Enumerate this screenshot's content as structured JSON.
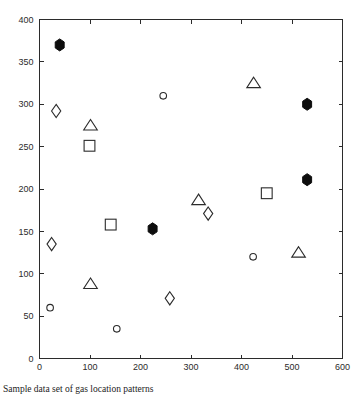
{
  "caption": "Sample data set of gas location patterns",
  "colors": {
    "axis": "#2b2b2b",
    "marker_open_stroke": "#2b2b2b",
    "marker_filled": "#0d0d0d",
    "background": "#ffffff"
  },
  "chart_data": {
    "type": "scatter",
    "title": "",
    "xlabel": "",
    "ylabel": "",
    "xlim": [
      0,
      600
    ],
    "ylim": [
      0,
      400
    ],
    "xticks": [
      0,
      100,
      200,
      300,
      400,
      500,
      600
    ],
    "yticks": [
      0,
      50,
      100,
      150,
      200,
      250,
      300,
      350,
      400
    ],
    "xticklabels": [
      "0",
      "100",
      "200",
      "300",
      "400",
      "500",
      "600"
    ],
    "yticklabels": [
      "0",
      "50",
      "100",
      "150",
      "200",
      "250",
      "300",
      "350",
      "400"
    ],
    "grid": false,
    "legend": "none",
    "series": [
      {
        "name": "filled-hexagon",
        "marker": "hexagon-filled",
        "filled": true,
        "points": [
          {
            "x": 40,
            "y": 370
          },
          {
            "x": 224,
            "y": 153
          },
          {
            "x": 530,
            "y": 300
          },
          {
            "x": 530,
            "y": 211
          }
        ]
      },
      {
        "name": "open-diamond",
        "marker": "diamond",
        "filled": false,
        "points": [
          {
            "x": 33,
            "y": 292
          },
          {
            "x": 24,
            "y": 135
          },
          {
            "x": 258,
            "y": 71
          },
          {
            "x": 334,
            "y": 171
          }
        ]
      },
      {
        "name": "open-triangle",
        "marker": "triangle",
        "filled": false,
        "points": [
          {
            "x": 101,
            "y": 275
          },
          {
            "x": 101,
            "y": 88
          },
          {
            "x": 315,
            "y": 187
          },
          {
            "x": 424,
            "y": 325
          },
          {
            "x": 513,
            "y": 125
          }
        ]
      },
      {
        "name": "open-square",
        "marker": "square",
        "filled": false,
        "points": [
          {
            "x": 99,
            "y": 251
          },
          {
            "x": 141,
            "y": 158
          },
          {
            "x": 450,
            "y": 195
          }
        ]
      },
      {
        "name": "open-circle",
        "marker": "circle",
        "filled": false,
        "points": [
          {
            "x": 21,
            "y": 60
          },
          {
            "x": 153,
            "y": 35
          },
          {
            "x": 245,
            "y": 310
          },
          {
            "x": 423,
            "y": 120
          }
        ]
      }
    ]
  }
}
